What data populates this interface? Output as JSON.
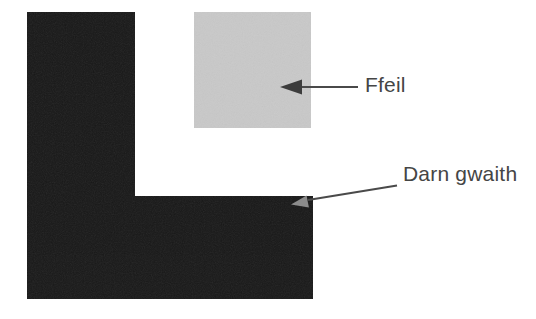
{
  "figure": {
    "type": "labeled-diagram",
    "background": "#ffffff"
  },
  "labels": {
    "file": "Ffeil",
    "workpiece": "Darn gwaith"
  },
  "colors": {
    "workpiece": "#181818",
    "file_block": "#c9c9c9",
    "leader_line": "#4a4a4a",
    "arrowhead_dark": "#3c3c3c",
    "arrowhead_light": "#8c8c8c",
    "label_text": "#454545"
  }
}
